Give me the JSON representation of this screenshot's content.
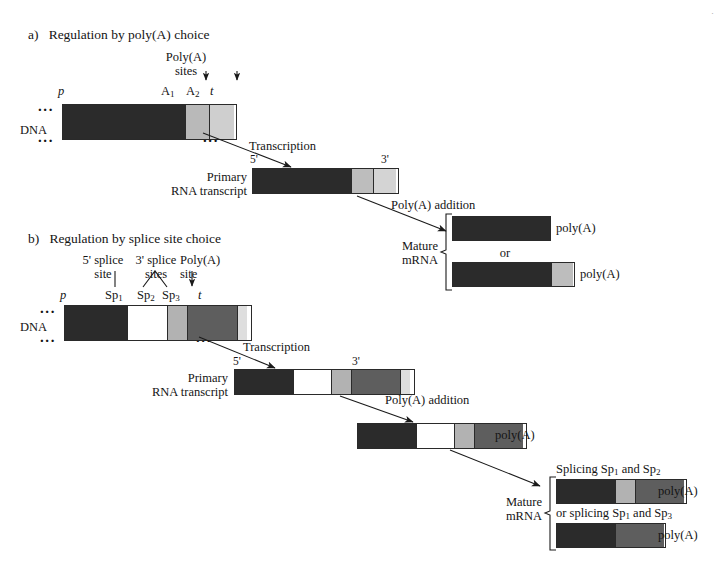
{
  "figure": {
    "panels": [
      {
        "id": "a",
        "label": "a)",
        "title": "Regulation by poly(A) choice",
        "callouts": {
          "polyA_sites_line1": "Poly(A)",
          "polyA_sites_line2": "sites"
        },
        "dna": {
          "row_label": "DNA",
          "promoter_label": "p",
          "terminator_label": "t",
          "site_labels": [
            "A",
            "A"
          ],
          "site_subscripts": [
            "1",
            "2"
          ],
          "left_dots": "...",
          "right_dots": "...",
          "segments": [
            {
              "name": "coding-exon",
              "width": 122,
              "color": "#2b2b2b"
            },
            {
              "name": "polyA1-region",
              "width": 24,
              "color": "#b9b9b9"
            },
            {
              "name": "polyA2-region",
              "width": 25,
              "color": "#cfcfcf"
            }
          ]
        },
        "transcription_label": "Transcription",
        "transcript": {
          "row_label_line1": "Primary",
          "row_label_line2": "RNA transcript",
          "five_prime": "5'",
          "three_prime": "3'",
          "segments": [
            {
              "name": "coding-exon",
              "width": 98,
              "color": "#2b2b2b"
            },
            {
              "name": "polyA1-region",
              "width": 22,
              "color": "#bdbdbd"
            },
            {
              "name": "polyA2-region",
              "width": 23,
              "color": "#d4d4d4"
            }
          ]
        },
        "polyA_addition_label": "Poly(A) addition",
        "mature": {
          "row_label_line1": "Mature",
          "row_label_line2": "mRNA",
          "or_label": "or",
          "products": [
            {
              "name": "mature-mrna-short",
              "tail_label": "poly(A)",
              "segments": [
                {
                  "name": "coding-exon",
                  "width": 97,
                  "color": "#2b2b2b"
                }
              ]
            },
            {
              "name": "mature-mrna-long",
              "tail_label": "poly(A)",
              "segments": [
                {
                  "name": "coding-exon",
                  "width": 98,
                  "color": "#2b2b2b"
                },
                {
                  "name": "extended-region",
                  "width": 22,
                  "color": "#bdbdbd"
                }
              ]
            }
          ]
        }
      },
      {
        "id": "b",
        "label": "b)",
        "title": "Regulation by splice site choice",
        "callouts": {
          "five_splice_line1": "5' splice",
          "five_splice_line2": "site",
          "three_splice_line1": "3' splice",
          "three_splice_line2": "sites",
          "polyA_line1": "Poly(A)",
          "polyA_line2": "site"
        },
        "dna": {
          "row_label": "DNA",
          "promoter_label": "p",
          "terminator_label": "t",
          "sp_labels": [
            "Sp",
            "Sp",
            "Sp"
          ],
          "sp_subscripts": [
            "1",
            "2",
            "3"
          ],
          "left_dots": "...",
          "right_dots": "...",
          "segments": [
            {
              "name": "exon1",
              "width": 62,
              "color": "#2b2b2b"
            },
            {
              "name": "intron",
              "width": 40,
              "color": "#ffffff"
            },
            {
              "name": "exon2-alt",
              "width": 20,
              "color": "#b2b2b2"
            },
            {
              "name": "exon3",
              "width": 50,
              "color": "#5e5e5e"
            },
            {
              "name": "polyA-region",
              "width": 10,
              "color": "#dedede"
            }
          ]
        },
        "transcription_label": "Transcription",
        "transcript": {
          "row_label_line1": "Primary",
          "row_label_line2": "RNA transcript",
          "five_prime": "5'",
          "three_prime": "3'",
          "segments": [
            {
              "name": "exon1",
              "width": 58,
              "color": "#2b2b2b"
            },
            {
              "name": "intron",
              "width": 38,
              "color": "#ffffff"
            },
            {
              "name": "exon2-alt",
              "width": 20,
              "color": "#b2b2b2"
            },
            {
              "name": "exon3",
              "width": 49,
              "color": "#5e5e5e"
            },
            {
              "name": "polyA-region",
              "width": 10,
              "color": "#dedede"
            }
          ]
        },
        "polyA_addition_label": "Poly(A) addition",
        "polyadenylated": {
          "name": "polyadenylated-transcript",
          "tail_label": "poly(A)",
          "segments": [
            {
              "name": "exon1",
              "width": 58,
              "color": "#2b2b2b"
            },
            {
              "name": "intron",
              "width": 38,
              "color": "#ffffff"
            },
            {
              "name": "exon2-alt",
              "width": 20,
              "color": "#b2b2b2"
            },
            {
              "name": "exon3",
              "width": 49,
              "color": "#5e5e5e"
            }
          ]
        },
        "mature": {
          "row_label_line1": "Mature",
          "row_label_line2": "mRNA",
          "products": [
            {
              "name": "spliced-sp1-sp2",
              "caption_pre": "Splicing Sp",
              "caption_sub1": "1",
              "caption_mid": " and  Sp",
              "caption_sub2": "2",
              "tail_label": "poly(A)",
              "segments": [
                {
                  "name": "exon1",
                  "width": 58,
                  "color": "#2b2b2b"
                },
                {
                  "name": "exon2-alt",
                  "width": 20,
                  "color": "#b2b2b2"
                },
                {
                  "name": "exon3",
                  "width": 49,
                  "color": "#5e5e5e"
                }
              ]
            },
            {
              "name": "spliced-sp1-sp3",
              "caption_pre": "or splicing Sp",
              "caption_sub1": "1",
              "caption_mid": " and  Sp",
              "caption_sub2": "3",
              "tail_label": "poly(A)",
              "segments": [
                {
                  "name": "exon1",
                  "width": 58,
                  "color": "#2b2b2b"
                },
                {
                  "name": "exon3",
                  "width": 49,
                  "color": "#5e5e5e"
                }
              ]
            }
          ]
        }
      }
    ]
  }
}
